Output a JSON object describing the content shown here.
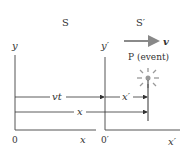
{
  "frames": {
    "S": {
      "label": "S",
      "y_axis": "y",
      "x_axis": "x",
      "origin": "0"
    },
    "S_prime": {
      "label": "S′",
      "y_axis": "y′",
      "x_axis": "x′",
      "origin": "0′"
    }
  },
  "velocity": {
    "label": "v"
  },
  "event": {
    "label": "P (event)"
  },
  "measures": {
    "vt": "vt",
    "x_prime": "x′",
    "x": "x"
  },
  "colors": {
    "axis": "#555555",
    "velocity_arrow": "#8a8a8a",
    "event": "#999999"
  }
}
